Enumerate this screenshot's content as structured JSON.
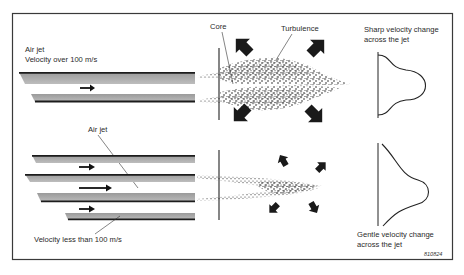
{
  "diagram": {
    "colors": {
      "frame": "#3a3a3a",
      "plate_fill": "#a9a9a9",
      "plate_edge": "#1c1c1c",
      "ink": "#1e1e1e",
      "background": "#ffffff"
    },
    "top_panel": {
      "title_line1": "Air jet",
      "title_line2": "Velocity over 100 m/s",
      "core_label": "Core",
      "turbulence_label": "Turbulence",
      "profile_label_line1": "Sharp velocity change",
      "profile_label_line2": "across the jet",
      "arrow_count": 1,
      "turbulence_arrows": 4
    },
    "bottom_panel": {
      "air_jet_label": "Air jet",
      "velocity_label": "Velocity less than 100 m/s",
      "profile_label_line1": "Gentle velocity change",
      "profile_label_line2": "across the jet",
      "arrow_count": 3,
      "turbulence_arrows": 4
    },
    "figure_code": "810824"
  }
}
